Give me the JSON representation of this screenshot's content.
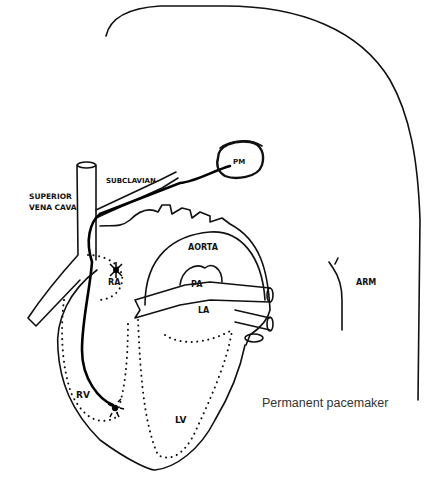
{
  "figure": {
    "caption": "Permanent pacemaker",
    "labels": {
      "superior_vena_cava_line1": "SUPERIOR",
      "superior_vena_cava_line2": "VENA CAVA",
      "subclavian": "SUBCLAVIAN",
      "pacemaker": "PM",
      "aorta": "AORTA",
      "pulmonary_artery": "PA",
      "left_atrium": "LA",
      "right_atrium": "RA",
      "right_ventricle": "RV",
      "left_ventricle": "LV",
      "arm": "ARM"
    }
  }
}
